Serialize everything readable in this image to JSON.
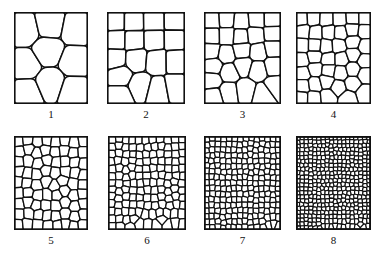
{
  "figure": {
    "kind": "grain-size-comparison-chart",
    "background_color": "#ffffff",
    "line_color": "#111111",
    "cell_fill_color": "#ffffff",
    "width": 378,
    "height": 261,
    "rows": 2,
    "columns": 4
  },
  "panels": [
    {
      "label": "1",
      "x": 14,
      "y": 12,
      "w": 74,
      "h": 92,
      "label_x": 14,
      "label_y": 108,
      "label_w": 74,
      "cells": 9,
      "seed": 101,
      "border_width": 1.6,
      "grain_width": 1.5,
      "relax": 3,
      "jitter": 0.34
    },
    {
      "label": "2",
      "x": 107,
      "y": 12,
      "w": 78,
      "h": 92,
      "label_x": 107,
      "label_y": 108,
      "label_w": 78,
      "cells": 17,
      "seed": 202,
      "border_width": 1.6,
      "grain_width": 1.5,
      "relax": 3,
      "jitter": 0.33
    },
    {
      "label": "3",
      "x": 204,
      "y": 12,
      "w": 77,
      "h": 92,
      "label_x": 204,
      "label_y": 108,
      "label_w": 77,
      "cells": 26,
      "seed": 303,
      "border_width": 1.6,
      "grain_width": 1.4,
      "relax": 3,
      "jitter": 0.32
    },
    {
      "label": "4",
      "x": 296,
      "y": 12,
      "w": 75,
      "h": 92,
      "label_x": 296,
      "label_y": 108,
      "label_w": 75,
      "cells": 40,
      "seed": 404,
      "border_width": 1.6,
      "grain_width": 1.35,
      "relax": 3,
      "jitter": 0.31
    },
    {
      "label": "5",
      "x": 14,
      "y": 136,
      "w": 74,
      "h": 94,
      "label_x": 14,
      "label_y": 234,
      "label_w": 74,
      "cells": 72,
      "seed": 505,
      "border_width": 1.7,
      "grain_width": 1.3,
      "relax": 3,
      "jitter": 0.3
    },
    {
      "label": "6",
      "x": 108,
      "y": 136,
      "w": 78,
      "h": 94,
      "label_x": 108,
      "label_y": 234,
      "label_w": 78,
      "cells": 135,
      "seed": 606,
      "border_width": 1.7,
      "grain_width": 1.25,
      "relax": 3,
      "jitter": 0.29
    },
    {
      "label": "7",
      "x": 204,
      "y": 136,
      "w": 77,
      "h": 94,
      "label_x": 204,
      "label_y": 234,
      "label_w": 77,
      "cells": 235,
      "seed": 707,
      "border_width": 1.8,
      "grain_width": 1.2,
      "relax": 3,
      "jitter": 0.28
    },
    {
      "label": "8",
      "x": 296,
      "y": 136,
      "w": 75,
      "h": 94,
      "label_x": 296,
      "label_y": 234,
      "label_w": 75,
      "cells": 420,
      "seed": 808,
      "border_width": 1.9,
      "grain_width": 1.15,
      "relax": 3,
      "jitter": 0.27
    }
  ]
}
